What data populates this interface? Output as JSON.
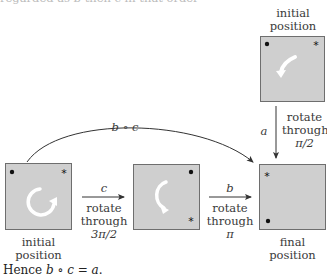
{
  "header": {
    "partial_text": "regarded as b then c in that order"
  },
  "top_box": {
    "label_line1": "initial",
    "label_line2": "position"
  },
  "vertical_arrow": {
    "symbol": "a",
    "desc_line1": "rotate",
    "desc_line2": "through",
    "desc_line3": "π/2"
  },
  "curved_arrow": {
    "symbol": "b ∘ c"
  },
  "box_initial": {
    "label_line1": "initial",
    "label_line2": "position"
  },
  "arrow_c": {
    "symbol": "c",
    "desc_line1": "rotate",
    "desc_line2": "through",
    "desc_line3": "3π/2"
  },
  "arrow_b": {
    "symbol": "b",
    "desc_line1": "rotate",
    "desc_line2": "through",
    "desc_line3": "π"
  },
  "box_final": {
    "label_line1": "final",
    "label_line2": "position"
  },
  "conclusion": {
    "prefix": "Hence ",
    "equation": "b ∘ c = a",
    "suffix": "."
  },
  "markers": {
    "dot": "•",
    "star": "*"
  },
  "colors": {
    "box_fill": "#cfcfcf",
    "box_border": "#6e6e6e",
    "arrow": "#333333",
    "rotation_arrow": "#ffffff"
  }
}
